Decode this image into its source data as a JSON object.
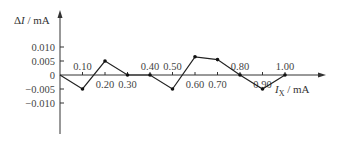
{
  "chart_data": {
    "type": "line",
    "title": "",
    "xlabel": "I_X / mA",
    "ylabel": "ΔI / mA",
    "x": [
      0.0,
      0.1,
      0.2,
      0.3,
      0.4,
      0.5,
      0.6,
      0.7,
      0.8,
      0.9,
      1.0
    ],
    "series": [
      {
        "name": "ΔI",
        "values": [
          0.0,
          -0.005,
          0.005,
          0.0,
          0.0,
          -0.005,
          0.0065,
          0.0055,
          0.0,
          -0.005,
          0.0
        ]
      }
    ],
    "x_tick_labels": [
      "0.10",
      "0.20",
      "0.30",
      "0.40",
      "0.50",
      "0.60",
      "0.70",
      "0.80",
      "0.90",
      "1.00"
    ],
    "y_tick_labels": [
      "0.010",
      "0.005",
      "0",
      "−0.005",
      "−0.010"
    ],
    "ylim": [
      -0.012,
      0.013
    ],
    "xlim": [
      0,
      1.05
    ],
    "grid": false,
    "legend": "none"
  },
  "labels": {
    "ylabel_delta": "Δ",
    "ylabel_var": "I",
    "ylabel_unit": " / mA",
    "xlabel_var": "I",
    "xlabel_sub": "X",
    "xlabel_unit": " / mA"
  }
}
